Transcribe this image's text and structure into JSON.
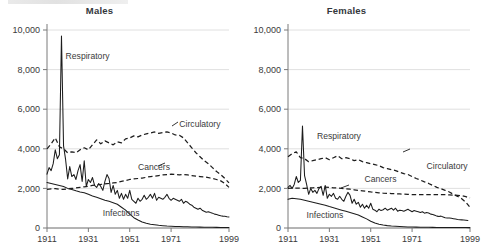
{
  "figure": {
    "panels": [
      {
        "key": "males",
        "title": "Males"
      },
      {
        "key": "females",
        "title": "Females"
      }
    ]
  },
  "chart_data": [
    {
      "type": "line",
      "title": "Males",
      "xlabel": "",
      "ylabel": "",
      "xlim": [
        1911,
        1999
      ],
      "ylim": [
        0,
        10000
      ],
      "grid": true,
      "legend_position": "inline-annotations",
      "xticks": [
        1911,
        1931,
        1951,
        1971,
        1999
      ],
      "xticklabels": [
        "1911",
        "1931",
        "1951",
        "1971",
        "1999"
      ],
      "yticks": [
        0,
        2000,
        4000,
        6000,
        8000,
        10000
      ],
      "yticklabels": [
        "0",
        "2,000",
        "4,000",
        "6,000",
        "8,000",
        "10,000"
      ],
      "annotations": [
        {
          "text": "Respiratory",
          "x": 1920,
          "y": 8550
        },
        {
          "text": "Circulatory",
          "x": 1975,
          "y": 5100
        },
        {
          "text": "Cancers",
          "x": 1955,
          "y": 2950
        },
        {
          "text": "Infections",
          "x": 1938,
          "y": 620
        }
      ],
      "series": [
        {
          "name": "Respiratory",
          "style": "solid",
          "x": [
            1911,
            1912,
            1913,
            1914,
            1915,
            1916,
            1917,
            1918,
            1919,
            1920,
            1921,
            1922,
            1923,
            1924,
            1925,
            1926,
            1927,
            1928,
            1929,
            1930,
            1931,
            1932,
            1933,
            1934,
            1935,
            1936,
            1937,
            1938,
            1939,
            1940,
            1941,
            1942,
            1943,
            1944,
            1945,
            1946,
            1947,
            1948,
            1949,
            1950,
            1951,
            1952,
            1953,
            1954,
            1955,
            1956,
            1957,
            1958,
            1959,
            1960,
            1961,
            1962,
            1963,
            1964,
            1965,
            1966,
            1967,
            1968,
            1969,
            1970,
            1971,
            1972,
            1973,
            1974,
            1975,
            1976,
            1977,
            1978,
            1979,
            1980,
            1981,
            1982,
            1983,
            1984,
            1985,
            1986,
            1987,
            1988,
            1989,
            1990,
            1991,
            1992,
            1993,
            1994,
            1995,
            1996,
            1997,
            1998,
            1999
          ],
          "values": [
            2720,
            3050,
            2900,
            3250,
            3950,
            3500,
            3700,
            9700,
            4150,
            3450,
            2480,
            3100,
            2600,
            2700,
            2450,
            2900,
            3200,
            2350,
            3400,
            2100,
            2450,
            2300,
            2550,
            2150,
            2050,
            2250,
            2100,
            1900,
            2350,
            2700,
            2500,
            1800,
            2150,
            1700,
            1900,
            1500,
            1750,
            1450,
            1700,
            1500,
            1900,
            1450,
            1350,
            1250,
            1500,
            1350,
            1450,
            1650,
            1450,
            1550,
            1700,
            1500,
            1750,
            1400,
            1550,
            1500,
            1450,
            1550,
            1700,
            1500,
            1400,
            1500,
            1450,
            1400,
            1350,
            1450,
            1250,
            1350,
            1300,
            1200,
            1150,
            1050,
            1000,
            950,
            1000,
            900,
            850,
            800,
            820,
            780,
            750,
            700,
            680,
            650,
            620,
            600,
            590,
            570,
            560
          ]
        },
        {
          "name": "Circulatory",
          "style": "dashed",
          "x": [
            1911,
            1913,
            1915,
            1917,
            1919,
            1921,
            1923,
            1925,
            1927,
            1929,
            1931,
            1933,
            1935,
            1937,
            1939,
            1941,
            1943,
            1945,
            1947,
            1949,
            1951,
            1953,
            1955,
            1957,
            1959,
            1961,
            1963,
            1965,
            1967,
            1969,
            1971,
            1973,
            1975,
            1977,
            1979,
            1981,
            1983,
            1985,
            1987,
            1989,
            1991,
            1993,
            1995,
            1997,
            1999
          ],
          "values": [
            4000,
            4250,
            4550,
            4100,
            4000,
            3800,
            3850,
            3800,
            3950,
            4050,
            3950,
            4200,
            4450,
            4250,
            4400,
            4300,
            4200,
            4350,
            4300,
            4500,
            4550,
            4650,
            4600,
            4700,
            4750,
            4800,
            4850,
            4780,
            4820,
            4850,
            4800,
            4700,
            4680,
            4550,
            4300,
            4050,
            3800,
            3600,
            3400,
            3250,
            3050,
            2850,
            2700,
            2500,
            2280
          ]
        },
        {
          "name": "Cancers",
          "style": "dashed",
          "x": [
            1911,
            1913,
            1915,
            1917,
            1919,
            1921,
            1923,
            1925,
            1927,
            1929,
            1931,
            1933,
            1935,
            1937,
            1939,
            1941,
            1943,
            1945,
            1947,
            1949,
            1951,
            1953,
            1955,
            1957,
            1959,
            1961,
            1963,
            1965,
            1967,
            1969,
            1971,
            1973,
            1975,
            1977,
            1979,
            1981,
            1983,
            1985,
            1987,
            1989,
            1991,
            1993,
            1995,
            1997,
            1999
          ],
          "values": [
            1950,
            1980,
            1990,
            1960,
            1950,
            1980,
            2000,
            2020,
            2050,
            2080,
            2100,
            2150,
            2180,
            2200,
            2230,
            2250,
            2280,
            2300,
            2350,
            2400,
            2450,
            2480,
            2500,
            2520,
            2560,
            2600,
            2620,
            2650,
            2680,
            2700,
            2720,
            2700,
            2680,
            2700,
            2680,
            2650,
            2620,
            2600,
            2580,
            2550,
            2500,
            2450,
            2380,
            2250,
            2050
          ]
        },
        {
          "name": "Infections",
          "style": "solid",
          "x": [
            1911,
            1913,
            1915,
            1917,
            1919,
            1921,
            1923,
            1925,
            1927,
            1929,
            1931,
            1933,
            1935,
            1937,
            1939,
            1941,
            1943,
            1945,
            1947,
            1949,
            1951,
            1953,
            1955,
            1957,
            1959,
            1961,
            1963,
            1965,
            1967,
            1969,
            1971,
            1973,
            1975,
            1977,
            1979,
            1981,
            1983,
            1985,
            1987,
            1989,
            1991,
            1993,
            1995,
            1997,
            1999
          ],
          "values": [
            2300,
            2250,
            2200,
            2150,
            2100,
            2000,
            1950,
            1880,
            1820,
            1780,
            1700,
            1620,
            1550,
            1480,
            1400,
            1350,
            1280,
            1200,
            1050,
            900,
            700,
            520,
            400,
            300,
            240,
            190,
            160,
            135,
            115,
            100,
            90,
            80,
            72,
            65,
            58,
            52,
            48,
            44,
            40,
            38,
            35,
            32,
            30,
            28,
            26
          ]
        }
      ]
    },
    {
      "type": "line",
      "title": "Females",
      "xlabel": "",
      "ylabel": "",
      "xlim": [
        1911,
        1999
      ],
      "ylim": [
        0,
        10000
      ],
      "grid": true,
      "legend_position": "inline-annotations",
      "xticks": [
        1911,
        1931,
        1951,
        1971,
        1999
      ],
      "xticklabels": [
        "1911",
        "1931",
        "1951",
        "1971",
        "1999"
      ],
      "yticks": [
        0,
        2000,
        4000,
        6000,
        8000,
        10000
      ],
      "yticklabels": [
        "0",
        "2,000",
        "4,000",
        "6,000",
        "8,000",
        "10,000"
      ],
      "annotations": [
        {
          "text": "Respiratory",
          "x": 1925,
          "y": 4500
        },
        {
          "text": "Circulatory",
          "x": 1978,
          "y": 3000
        },
        {
          "text": "Cancers",
          "x": 1948,
          "y": 2300
        },
        {
          "text": "Infections",
          "x": 1920,
          "y": 520
        }
      ],
      "series": [
        {
          "name": "Respiratory",
          "style": "solid",
          "x": [
            1911,
            1912,
            1913,
            1914,
            1915,
            1916,
            1917,
            1918,
            1919,
            1920,
            1921,
            1922,
            1923,
            1924,
            1925,
            1926,
            1927,
            1928,
            1929,
            1930,
            1931,
            1932,
            1933,
            1934,
            1935,
            1936,
            1937,
            1938,
            1939,
            1940,
            1941,
            1942,
            1943,
            1944,
            1945,
            1946,
            1947,
            1948,
            1949,
            1950,
            1951,
            1952,
            1953,
            1954,
            1955,
            1956,
            1957,
            1958,
            1959,
            1960,
            1961,
            1962,
            1963,
            1964,
            1965,
            1966,
            1967,
            1968,
            1969,
            1970,
            1971,
            1972,
            1973,
            1974,
            1975,
            1976,
            1977,
            1978,
            1979,
            1980,
            1981,
            1982,
            1983,
            1984,
            1985,
            1986,
            1987,
            1988,
            1989,
            1990,
            1991,
            1992,
            1993,
            1994,
            1995,
            1996,
            1997,
            1998,
            1999
          ],
          "values": [
            2050,
            2150,
            2000,
            2200,
            2600,
            2300,
            2400,
            5150,
            2650,
            2200,
            1700,
            2000,
            1800,
            1900,
            1750,
            2000,
            2100,
            1650,
            2150,
            1500,
            1700,
            1600,
            1750,
            1500,
            1450,
            1600,
            1450,
            1350,
            1600,
            1800,
            1650,
            1250,
            1450,
            1200,
            1300,
            1050,
            1200,
            1000,
            1150,
            1000,
            1250,
            950,
            900,
            820,
            950,
            880,
            920,
            1000,
            900,
            950,
            1000,
            900,
            1000,
            850,
            900,
            880,
            850,
            900,
            950,
            880,
            820,
            880,
            850,
            820,
            780,
            820,
            750,
            780,
            760,
            700,
            680,
            640,
            600,
            580,
            600,
            560,
            520,
            500,
            510,
            490,
            470,
            450,
            430,
            420,
            410,
            400,
            390,
            380
          ]
        },
        {
          "name": "Circulatory",
          "style": "dashed",
          "x": [
            1911,
            1913,
            1915,
            1917,
            1919,
            1921,
            1923,
            1925,
            1927,
            1929,
            1931,
            1933,
            1935,
            1937,
            1939,
            1941,
            1943,
            1945,
            1947,
            1949,
            1951,
            1953,
            1955,
            1957,
            1959,
            1961,
            1963,
            1965,
            1967,
            1969,
            1971,
            1973,
            1975,
            1977,
            1979,
            1981,
            1983,
            1985,
            1987,
            1989,
            1991,
            1993,
            1995,
            1997,
            1999
          ],
          "values": [
            3600,
            3750,
            3850,
            3550,
            3500,
            3350,
            3400,
            3450,
            3500,
            3550,
            3450,
            3550,
            3650,
            3500,
            3550,
            3500,
            3400,
            3450,
            3350,
            3300,
            3250,
            3200,
            3150,
            3050,
            3000,
            2950,
            2900,
            2820,
            2750,
            2700,
            2600,
            2500,
            2420,
            2330,
            2250,
            2150,
            2050,
            1980,
            1900,
            1820,
            1700,
            1600,
            1480,
            1300,
            1050
          ]
        },
        {
          "name": "Cancers",
          "style": "dashed",
          "x": [
            1911,
            1913,
            1915,
            1917,
            1919,
            1921,
            1923,
            1925,
            1927,
            1929,
            1931,
            1933,
            1935,
            1937,
            1939,
            1941,
            1943,
            1945,
            1947,
            1949,
            1951,
            1953,
            1955,
            1957,
            1959,
            1961,
            1963,
            1965,
            1967,
            1969,
            1971,
            1973,
            1975,
            1977,
            1979,
            1981,
            1983,
            1985,
            1987,
            1989,
            1991,
            1993,
            1995,
            1997,
            1999
          ],
          "values": [
            2000,
            2010,
            2020,
            2010,
            2000,
            2020,
            2030,
            2040,
            2050,
            2060,
            2050,
            2030,
            2020,
            2000,
            1980,
            1960,
            1930,
            1900,
            1880,
            1850,
            1820,
            1800,
            1780,
            1760,
            1750,
            1740,
            1730,
            1720,
            1710,
            1700,
            1690,
            1690,
            1680,
            1680,
            1680,
            1680,
            1680,
            1680,
            1680,
            1670,
            1660,
            1650,
            1630,
            1580,
            1520
          ]
        },
        {
          "name": "Infections",
          "style": "solid",
          "x": [
            1911,
            1913,
            1915,
            1917,
            1919,
            1921,
            1923,
            1925,
            1927,
            1929,
            1931,
            1933,
            1935,
            1937,
            1939,
            1941,
            1943,
            1945,
            1947,
            1949,
            1951,
            1953,
            1955,
            1957,
            1959,
            1961,
            1963,
            1965,
            1967,
            1969,
            1971,
            1973,
            1975,
            1977,
            1979,
            1981,
            1983,
            1985,
            1987,
            1989,
            1991,
            1993,
            1995,
            1997,
            1999
          ],
          "values": [
            1450,
            1500,
            1480,
            1450,
            1400,
            1350,
            1300,
            1250,
            1200,
            1150,
            1080,
            1020,
            960,
            900,
            840,
            780,
            720,
            660,
            560,
            460,
            340,
            250,
            190,
            150,
            120,
            100,
            85,
            72,
            62,
            55,
            50,
            45,
            42,
            38,
            35,
            32,
            30,
            28,
            26,
            25,
            24,
            23,
            22,
            21,
            20
          ]
        }
      ]
    }
  ]
}
